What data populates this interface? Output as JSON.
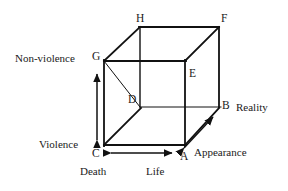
{
  "figure": {
    "stroke_color": "#111111",
    "background_color": "#ffffff",
    "vertices": [
      {
        "name": "A",
        "label": "A",
        "x": 180,
        "y": 151
      },
      {
        "name": "B",
        "label": "B",
        "x": 222,
        "y": 109
      },
      {
        "name": "C",
        "label": "C",
        "x": 97,
        "y": 152
      },
      {
        "name": "D",
        "label": "D",
        "x": 130,
        "y": 107
      },
      {
        "name": "E",
        "label": "E",
        "x": 190,
        "y": 79
      },
      {
        "name": "F",
        "label": "F",
        "x": 222,
        "y": 25
      },
      {
        "name": "G",
        "label": "G",
        "x": 97,
        "y": 59
      },
      {
        "name": "H",
        "label": "H",
        "x": 138,
        "y": 22
      }
    ],
    "axis_labels": [
      {
        "name": "non-violence",
        "label": "Non-violence",
        "x": 16,
        "y": 55
      },
      {
        "name": "violence",
        "label": "Violence",
        "x": 40,
        "y": 143
      },
      {
        "name": "reality",
        "label": "Reality",
        "x": 236,
        "y": 103
      },
      {
        "name": "appearance",
        "label": "Appearance",
        "x": 195,
        "y": 149
      },
      {
        "name": "death",
        "label": "Death",
        "x": 80,
        "y": 168
      },
      {
        "name": "life",
        "label": "Life",
        "x": 146,
        "y": 168
      }
    ],
    "axes": [
      {
        "name": "vertical-axis",
        "from": "Violence",
        "to": "Non-violence"
      },
      {
        "name": "horizontal-axis",
        "from": "Death",
        "to": "Life"
      },
      {
        "name": "depth-axis",
        "from": "Appearance",
        "to": "Reality"
      }
    ]
  }
}
